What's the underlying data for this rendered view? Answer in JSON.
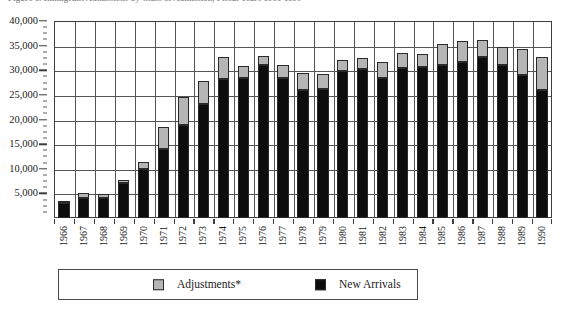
{
  "chart_data": {
    "type": "bar",
    "subtype": "stacked-column",
    "title": "Figure 1. Immigrant Admissions by Class of Admission, Fiscal Years 1966-1990",
    "xlabel": "",
    "ylabel": "",
    "ylim": [
      0,
      40000
    ],
    "ytick_values": [
      0,
      5000,
      10000,
      15000,
      20000,
      25000,
      30000,
      35000,
      40000
    ],
    "ytick_labels": [
      "0",
      "5,000",
      "10,000",
      "15,000",
      "20,000",
      "25,000",
      "30,000",
      "35,000",
      "40,000"
    ],
    "y_minor_tick_step": 1250,
    "grid": true,
    "grid_axis": "both",
    "legend_position": "bottom",
    "categories": [
      "1966",
      "1967",
      "1968",
      "1969",
      "1970",
      "1971",
      "1972",
      "1973",
      "1974",
      "1975",
      "1976",
      "1977",
      "1978",
      "1979",
      "1980",
      "1981",
      "1982",
      "1983",
      "1984",
      "1985",
      "1986",
      "1987",
      "1988",
      "1989",
      "1990"
    ],
    "series": [
      {
        "name": "New Arrivals",
        "color": "#0d0d0d",
        "values": [
          3100,
          4100,
          4100,
          7200,
          9900,
          14100,
          18900,
          23100,
          28200,
          28500,
          31000,
          28400,
          25900,
          26200,
          29900,
          30300,
          28400,
          30400,
          30600,
          31100,
          31600,
          32600,
          31100,
          29000,
          25900
        ]
      },
      {
        "name": "Adjustments*",
        "color": "#b5b5b5",
        "values": [
          100,
          1000,
          800,
          500,
          1500,
          4300,
          5600,
          4800,
          4500,
          2300,
          1800,
          2600,
          3500,
          3000,
          2200,
          2100,
          3300,
          3200,
          2800,
          4300,
          4400,
          3500,
          3600,
          5400,
          6800
        ]
      }
    ],
    "totals": [
      3200,
      5100,
      4900,
      7700,
      11400,
      18400,
      24500,
      27900,
      32700,
      30800,
      32800,
      31000,
      29400,
      29200,
      32100,
      32400,
      31700,
      33600,
      33400,
      35400,
      36000,
      36100,
      34700,
      34400,
      32700
    ]
  },
  "legend": {
    "entries": [
      {
        "label": "Adjustments*",
        "color": "#b5b5b5"
      },
      {
        "label": "New Arrivals",
        "color": "#0d0d0d"
      }
    ]
  }
}
